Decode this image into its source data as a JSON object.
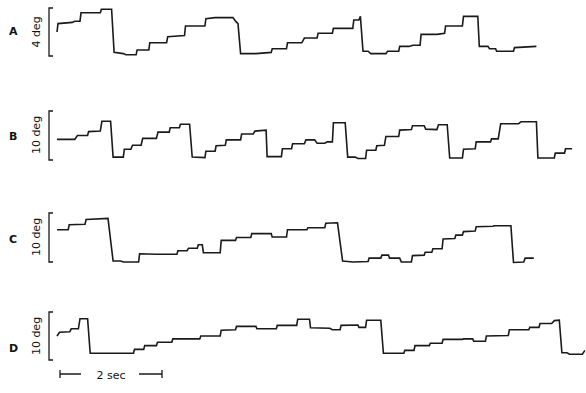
{
  "chart_data": {
    "type": "line",
    "title": "",
    "time_scale": {
      "label": "2 sec",
      "value_sec": 2
    },
    "xlabel": "",
    "ylabel": "",
    "xlim_sec": [
      0,
      10.1
    ],
    "panels": [
      {
        "id": "A",
        "label": "A",
        "scale_label": "4 deg",
        "scale_deg": 4,
        "steps": [
          [
            0.0,
            2.0
          ],
          [
            0.02,
            2.7
          ],
          [
            0.3,
            2.8
          ],
          [
            0.35,
            2.9
          ],
          [
            0.45,
            2.9
          ],
          [
            0.47,
            3.6
          ],
          [
            0.85,
            3.6
          ],
          [
            0.87,
            3.9
          ],
          [
            1.05,
            3.9
          ],
          [
            1.07,
            3.9
          ],
          [
            1.12,
            0.3
          ],
          [
            1.3,
            0.2
          ],
          [
            1.35,
            0.1
          ],
          [
            1.55,
            0.1
          ],
          [
            1.57,
            0.5
          ],
          [
            1.8,
            0.5
          ],
          [
            1.82,
            1.1
          ],
          [
            2.15,
            1.1
          ],
          [
            2.17,
            1.6
          ],
          [
            2.5,
            1.7
          ],
          [
            2.52,
            2.5
          ],
          [
            2.9,
            2.5
          ],
          [
            2.92,
            3.1
          ],
          [
            3.1,
            3.2
          ],
          [
            3.45,
            3.2
          ],
          [
            3.5,
            2.9
          ],
          [
            3.55,
            2.7
          ],
          [
            3.6,
            0.2
          ],
          [
            3.9,
            0.2
          ],
          [
            4.2,
            0.3
          ],
          [
            4.22,
            0.6
          ],
          [
            4.5,
            0.6
          ],
          [
            4.52,
            1.1
          ],
          [
            4.8,
            1.1
          ],
          [
            4.85,
            1.5
          ],
          [
            5.1,
            1.5
          ],
          [
            5.12,
            1.9
          ],
          [
            5.4,
            1.9
          ],
          [
            5.42,
            2.3
          ],
          [
            5.8,
            2.3
          ],
          [
            5.82,
            3.0
          ],
          [
            5.92,
            3.0
          ],
          [
            5.95,
            3.3
          ],
          [
            6.0,
            0.4
          ],
          [
            6.1,
            0.4
          ],
          [
            6.15,
            0.2
          ],
          [
            6.45,
            0.2
          ],
          [
            6.48,
            0.4
          ],
          [
            6.7,
            0.4
          ],
          [
            6.72,
            0.8
          ],
          [
            6.9,
            0.8
          ],
          [
            6.98,
            0.9
          ],
          [
            7.12,
            0.9
          ],
          [
            7.14,
            1.8
          ],
          [
            7.45,
            1.8
          ],
          [
            7.6,
            1.9
          ],
          [
            7.62,
            2.5
          ],
          [
            7.95,
            2.5
          ],
          [
            7.97,
            3.3
          ],
          [
            8.25,
            3.3
          ],
          [
            8.28,
            0.8
          ],
          [
            8.45,
            0.8
          ],
          [
            8.48,
            0.6
          ],
          [
            8.6,
            0.6
          ],
          [
            8.62,
            0.4
          ],
          [
            8.95,
            0.4
          ],
          [
            8.97,
            0.7
          ],
          [
            9.4,
            0.8
          ]
        ]
      },
      {
        "id": "B",
        "label": "B",
        "scale_label": "10 deg",
        "scale_deg": 10,
        "steps": [
          [
            0.0,
            4.2
          ],
          [
            0.35,
            4.2
          ],
          [
            0.4,
            5.0
          ],
          [
            0.6,
            5.0
          ],
          [
            0.62,
            5.8
          ],
          [
            0.85,
            5.9
          ],
          [
            0.88,
            7.9
          ],
          [
            1.05,
            7.9
          ],
          [
            1.1,
            0.6
          ],
          [
            1.3,
            0.6
          ],
          [
            1.32,
            2.2
          ],
          [
            1.45,
            2.2
          ],
          [
            1.48,
            3.0
          ],
          [
            1.65,
            3.0
          ],
          [
            1.68,
            4.4
          ],
          [
            1.95,
            4.4
          ],
          [
            1.98,
            5.7
          ],
          [
            2.2,
            5.7
          ],
          [
            2.22,
            6.6
          ],
          [
            2.4,
            6.6
          ],
          [
            2.42,
            7.3
          ],
          [
            2.6,
            7.3
          ],
          [
            2.65,
            0.6
          ],
          [
            2.9,
            0.5
          ],
          [
            2.92,
            1.8
          ],
          [
            3.1,
            1.8
          ],
          [
            3.12,
            2.9
          ],
          [
            3.3,
            3.0
          ],
          [
            3.32,
            4.1
          ],
          [
            3.6,
            4.1
          ],
          [
            3.62,
            5.3
          ],
          [
            3.85,
            5.3
          ],
          [
            3.88,
            5.9
          ],
          [
            4.1,
            6.1
          ],
          [
            4.12,
            0.7
          ],
          [
            4.4,
            0.7
          ],
          [
            4.42,
            2.3
          ],
          [
            4.6,
            2.3
          ],
          [
            4.62,
            3.3
          ],
          [
            4.85,
            3.3
          ],
          [
            4.88,
            4.1
          ],
          [
            5.05,
            4.1
          ],
          [
            5.1,
            3.4
          ],
          [
            5.25,
            3.4
          ],
          [
            5.3,
            3.7
          ],
          [
            5.4,
            3.7
          ],
          [
            5.42,
            7.6
          ],
          [
            5.65,
            7.6
          ],
          [
            5.7,
            0.6
          ],
          [
            5.85,
            0.6
          ],
          [
            5.9,
            0.3
          ],
          [
            6.05,
            0.3
          ],
          [
            6.07,
            2.0
          ],
          [
            6.25,
            2.0
          ],
          [
            6.27,
            2.9
          ],
          [
            6.42,
            3.0
          ],
          [
            6.45,
            4.8
          ],
          [
            6.7,
            4.8
          ],
          [
            6.72,
            6.1
          ],
          [
            6.95,
            6.2
          ],
          [
            6.97,
            7.0
          ],
          [
            7.2,
            7.0
          ],
          [
            7.23,
            6.3
          ],
          [
            7.45,
            6.2
          ],
          [
            7.48,
            7.2
          ],
          [
            7.65,
            7.2
          ],
          [
            7.7,
            0.4
          ],
          [
            7.95,
            0.4
          ],
          [
            7.97,
            2.2
          ],
          [
            8.2,
            2.3
          ],
          [
            8.22,
            3.7
          ],
          [
            8.5,
            3.7
          ],
          [
            8.52,
            4.3
          ],
          [
            8.65,
            4.3
          ],
          [
            8.7,
            7.4
          ],
          [
            9.05,
            7.4
          ],
          [
            9.1,
            7.8
          ],
          [
            9.4,
            7.8
          ],
          [
            9.43,
            0.4
          ],
          [
            9.75,
            0.4
          ],
          [
            9.77,
            1.4
          ],
          [
            9.95,
            1.4
          ],
          [
            9.97,
            2.3
          ],
          [
            10.1,
            2.3
          ]
        ]
      },
      {
        "id": "C",
        "label": "C",
        "scale_label": "10 deg",
        "scale_deg": 10,
        "steps": [
          [
            0.0,
            6.6
          ],
          [
            0.22,
            6.6
          ],
          [
            0.24,
            7.6
          ],
          [
            0.55,
            7.7
          ],
          [
            0.57,
            8.7
          ],
          [
            1.0,
            8.9
          ],
          [
            1.1,
            0.2
          ],
          [
            1.25,
            0.2
          ],
          [
            1.3,
            0.0
          ],
          [
            1.6,
            0.0
          ],
          [
            1.62,
            1.7
          ],
          [
            1.95,
            1.6
          ],
          [
            2.35,
            1.6
          ],
          [
            2.37,
            2.3
          ],
          [
            2.55,
            2.3
          ],
          [
            2.58,
            2.8
          ],
          [
            2.75,
            2.8
          ],
          [
            2.77,
            3.5
          ],
          [
            2.85,
            3.5
          ],
          [
            2.87,
            1.9
          ],
          [
            3.2,
            1.9
          ],
          [
            3.22,
            4.4
          ],
          [
            3.5,
            4.4
          ],
          [
            3.52,
            5.0
          ],
          [
            3.8,
            5.0
          ],
          [
            3.82,
            5.8
          ],
          [
            4.2,
            5.8
          ],
          [
            4.22,
            5.1
          ],
          [
            4.5,
            5.1
          ],
          [
            4.52,
            6.6
          ],
          [
            4.9,
            6.6
          ],
          [
            4.92,
            7.0
          ],
          [
            5.25,
            7.0
          ],
          [
            5.27,
            7.9
          ],
          [
            5.5,
            8.0
          ],
          [
            5.6,
            0.2
          ],
          [
            5.7,
            0.1
          ],
          [
            5.8,
            0.0
          ],
          [
            6.1,
            0.1
          ],
          [
            6.12,
            0.8
          ],
          [
            6.35,
            0.8
          ],
          [
            6.37,
            1.4
          ],
          [
            6.5,
            1.4
          ],
          [
            6.52,
            0.8
          ],
          [
            6.72,
            0.8
          ],
          [
            6.75,
            0.0
          ],
          [
            6.95,
            0.0
          ],
          [
            6.97,
            1.3
          ],
          [
            7.2,
            1.4
          ],
          [
            7.22,
            2.0
          ],
          [
            7.35,
            2.0
          ],
          [
            7.37,
            2.7
          ],
          [
            7.55,
            2.7
          ],
          [
            7.57,
            4.7
          ],
          [
            7.8,
            4.8
          ],
          [
            7.82,
            5.5
          ],
          [
            7.95,
            5.5
          ],
          [
            7.97,
            6.2
          ],
          [
            8.2,
            6.3
          ],
          [
            8.22,
            7.2
          ],
          [
            8.55,
            7.3
          ],
          [
            8.57,
            7.4
          ],
          [
            8.9,
            7.4
          ],
          [
            8.95,
            -0.1
          ],
          [
            9.15,
            0.0
          ],
          [
            9.18,
            0.8
          ],
          [
            9.35,
            0.8
          ]
        ]
      },
      {
        "id": "D",
        "label": "D",
        "scale_label": "10 deg",
        "scale_deg": 10,
        "steps": [
          [
            0.0,
            5.0
          ],
          [
            0.05,
            5.8
          ],
          [
            0.25,
            5.9
          ],
          [
            0.28,
            6.5
          ],
          [
            0.42,
            6.5
          ],
          [
            0.45,
            8.6
          ],
          [
            0.6,
            8.6
          ],
          [
            0.65,
            1.4
          ],
          [
            1.0,
            1.4
          ],
          [
            1.5,
            1.4
          ],
          [
            1.52,
            2.2
          ],
          [
            1.7,
            2.2
          ],
          [
            1.72,
            3.0
          ],
          [
            1.95,
            3.0
          ],
          [
            1.97,
            3.7
          ],
          [
            2.25,
            3.7
          ],
          [
            2.27,
            4.4
          ],
          [
            2.8,
            4.4
          ],
          [
            2.82,
            5.0
          ],
          [
            3.2,
            5.0
          ],
          [
            3.22,
            6.2
          ],
          [
            3.5,
            6.3
          ],
          [
            3.52,
            7.0
          ],
          [
            3.9,
            7.0
          ],
          [
            3.92,
            6.5
          ],
          [
            4.3,
            6.5
          ],
          [
            4.32,
            7.2
          ],
          [
            4.7,
            7.2
          ],
          [
            4.72,
            8.5
          ],
          [
            4.95,
            8.5
          ],
          [
            4.97,
            6.7
          ],
          [
            5.35,
            6.6
          ],
          [
            5.4,
            6.3
          ],
          [
            5.55,
            6.3
          ],
          [
            5.57,
            7.2
          ],
          [
            5.9,
            7.3
          ],
          [
            5.92,
            6.8
          ],
          [
            6.05,
            6.8
          ],
          [
            6.07,
            8.3
          ],
          [
            6.35,
            8.3
          ],
          [
            6.4,
            1.4
          ],
          [
            6.8,
            1.4
          ],
          [
            6.82,
            2.0
          ],
          [
            7.0,
            2.0
          ],
          [
            7.02,
            3.0
          ],
          [
            7.3,
            3.0
          ],
          [
            7.32,
            3.5
          ],
          [
            7.55,
            3.5
          ],
          [
            7.57,
            4.3
          ],
          [
            7.95,
            4.3
          ],
          [
            7.97,
            4.4
          ],
          [
            8.15,
            4.4
          ],
          [
            8.17,
            3.9
          ],
          [
            8.4,
            3.9
          ],
          [
            8.42,
            5.0
          ],
          [
            8.85,
            5.1
          ],
          [
            8.87,
            6.3
          ],
          [
            9.25,
            6.3
          ],
          [
            9.27,
            6.8
          ],
          [
            9.45,
            6.8
          ],
          [
            9.47,
            7.6
          ],
          [
            9.7,
            7.6
          ],
          [
            9.75,
            8.2
          ],
          [
            9.85,
            8.3
          ],
          [
            9.9,
            1.5
          ],
          [
            10.0,
            1.5
          ],
          [
            10.05,
            1.2
          ],
          [
            10.3,
            1.2
          ],
          [
            10.35,
            2.0
          ]
        ]
      }
    ]
  }
}
